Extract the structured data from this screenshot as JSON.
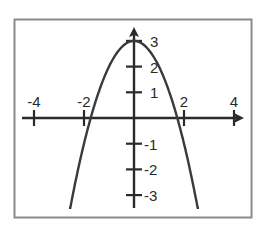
{
  "chart_data": {
    "type": "line",
    "title": "",
    "xlabel": "",
    "ylabel": "",
    "function": "y = 3 - x^2",
    "series": [
      {
        "name": "parabola",
        "x": [
          -2.6,
          -2.4,
          -2.2,
          -2.0,
          -1.8,
          -1.6,
          -1.4,
          -1.2,
          -1.0,
          -0.8,
          -0.6,
          -0.4,
          -0.2,
          0.0,
          0.2,
          0.4,
          0.6,
          0.8,
          1.0,
          1.2,
          1.4,
          1.6,
          1.8,
          2.0,
          2.2,
          2.4,
          2.6
        ],
        "y": [
          -3.5,
          -2.76,
          -1.84,
          -1.0,
          -0.24,
          0.44,
          1.04,
          1.56,
          2.0,
          2.36,
          2.64,
          2.84,
          2.96,
          3.0,
          2.96,
          2.84,
          2.64,
          2.36,
          2.0,
          1.56,
          1.04,
          0.44,
          -0.24,
          -1.0,
          -1.84,
          -2.76,
          -3.5
        ]
      }
    ],
    "x_ticks": [
      -4,
      -2,
      2,
      4
    ],
    "x_tick_labels": [
      "-4",
      "-2",
      "2",
      "4"
    ],
    "y_ticks": [
      3,
      2,
      1,
      -1,
      -2,
      -3
    ],
    "y_tick_labels": [
      "3",
      "2",
      "1",
      "-1",
      "-2",
      "-3"
    ],
    "xlim": [
      -4.5,
      4.4
    ],
    "ylim": [
      -3.5,
      3.5
    ],
    "grid": false,
    "legend": "none",
    "colors": {
      "line": "#3a3a3a",
      "axis": "#2a2a2a",
      "frame": "#8a8a8a",
      "background": "#ffffff"
    }
  }
}
